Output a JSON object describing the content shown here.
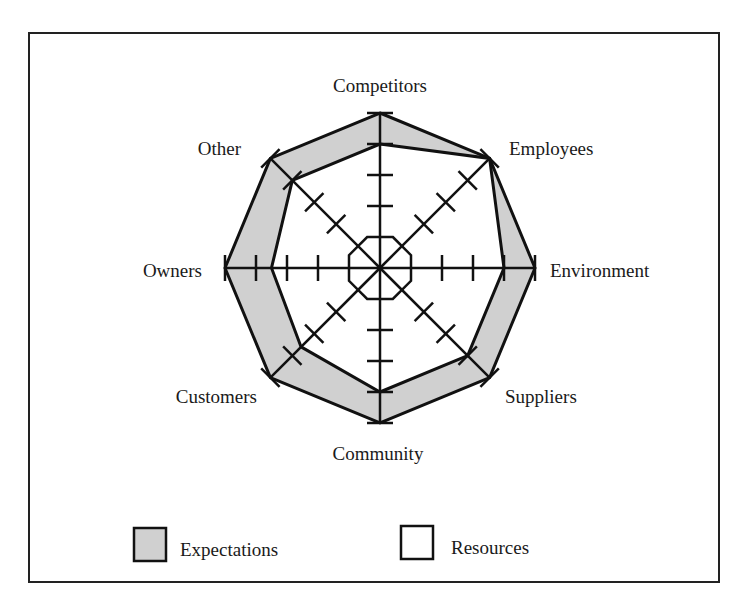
{
  "chart_data": {
    "type": "radar",
    "title": "",
    "scale": {
      "min": 0,
      "max": 5,
      "ticks": [
        1,
        2,
        3,
        4,
        5
      ]
    },
    "axes": [
      "Competitors",
      "Employees",
      "Environment",
      "Suppliers",
      "Community",
      "Customers",
      "Owners",
      "Other"
    ],
    "series": [
      {
        "name": "Expectations",
        "fill": "#d0d0d0",
        "values": [
          5,
          5,
          5,
          5,
          5,
          5,
          5,
          5
        ]
      },
      {
        "name": "Resources",
        "fill": "#ffffff",
        "values": [
          4,
          5,
          4,
          4,
          4,
          3.6,
          3.5,
          4
        ]
      }
    ],
    "legend": {
      "position": "bottom"
    }
  },
  "legend": {
    "items": [
      {
        "label": "Expectations",
        "swatch": "#d0d0d0"
      },
      {
        "label": "Resources",
        "swatch": "#ffffff"
      }
    ]
  },
  "colors": {
    "stroke": "#111111",
    "frame": "#222222"
  }
}
